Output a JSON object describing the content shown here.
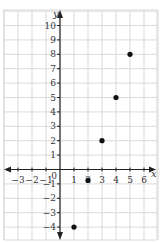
{
  "chart_data": {
    "type": "scatter",
    "title": "",
    "xlabel": "x",
    "ylabel": "y",
    "xlim": [
      -4,
      6.6
    ],
    "ylim": [
      -4.9,
      11
    ],
    "grid": true,
    "legend": null,
    "x_ticks": [
      -3,
      -2,
      -1,
      0,
      1,
      2,
      3,
      4,
      5,
      6
    ],
    "x_tick_labels": [
      "−3",
      "−2",
      "−1",
      "0",
      "1",
      "2",
      "3",
      "4",
      "5",
      "6"
    ],
    "y_ticks": [
      -4,
      -3,
      -2,
      -1,
      1,
      2,
      3,
      4,
      5,
      6,
      7,
      8,
      9,
      10
    ],
    "y_tick_labels": [
      "−4",
      "−3",
      "−2",
      "−1",
      "1",
      "2",
      "3",
      "4",
      "5",
      "6",
      "7",
      "8",
      "9",
      "10"
    ],
    "points": [
      {
        "x": 1,
        "y": -4
      },
      {
        "x": 2,
        "y": -0.75
      },
      {
        "x": 3,
        "y": 2
      },
      {
        "x": 4,
        "y": 5
      },
      {
        "x": 5,
        "y": 8
      }
    ]
  },
  "style": {
    "grid_color": "#d9d9d9",
    "axis_color": "#222222",
    "point_color": "#111111",
    "label_color": "#333333"
  }
}
